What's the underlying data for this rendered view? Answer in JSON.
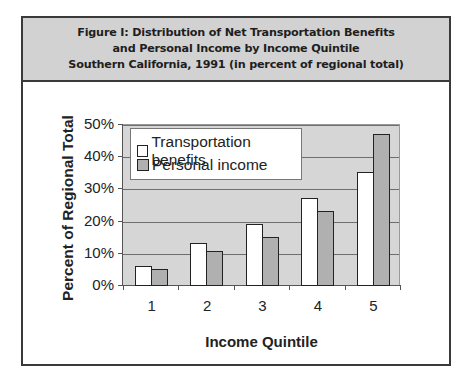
{
  "header": {
    "line1": "Figure I: Distribution of Net Transportation Benefits",
    "line2": "and Personal Income by Income Quintile",
    "line3": "Southern California, 1991 (in percent of regional total)"
  },
  "colors": {
    "header_bg": "#d2d2d2",
    "plot_bg": "#d6d6d6",
    "transportation_bar": "#ffffff",
    "personal_income_bar": "#b0b0b0"
  },
  "chart_data": {
    "type": "bar",
    "title": "Figure I: Distribution of Net Transportation Benefits and Personal Income by Income Quintile Southern California, 1991 (in percent of regional total)",
    "xlabel": "Income Quintile",
    "ylabel": "Percent of Regional Total",
    "categories": [
      "1",
      "2",
      "3",
      "4",
      "5"
    ],
    "series": [
      {
        "name": "Transportation benefits",
        "values": [
          6,
          13,
          19,
          27,
          35
        ]
      },
      {
        "name": "Personal income",
        "values": [
          5,
          10.5,
          15,
          23,
          47
        ]
      }
    ],
    "yticks": [
      "0%",
      "10%",
      "20%",
      "30%",
      "40%",
      "50%"
    ],
    "ylim": [
      0,
      50
    ],
    "grid": true,
    "legend_position": "upper left, inside plot"
  }
}
